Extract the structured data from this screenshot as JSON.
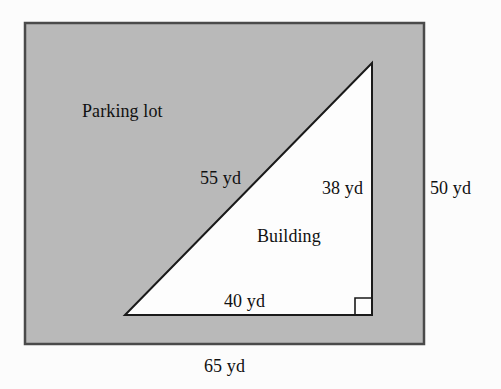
{
  "figure": {
    "background_color": "#fcfcfc",
    "lot": {
      "name": "Parking lot",
      "label": "Parking lot",
      "fill_color": "#b9b9b9",
      "stroke_color": "#4a4a4a",
      "width_label": "65 yd",
      "height_label": "50 yd"
    },
    "building": {
      "name": "Building",
      "label": "Building",
      "fill_color": "#ffffff",
      "stroke_color": "#1a1a1a",
      "hypotenuse_label": "55 yd",
      "vertical_leg_label": "38 yd",
      "horizontal_leg_label": "40 yd",
      "right_angle_marker": "square"
    },
    "labels": {
      "parking_lot": "Parking lot",
      "building": "Building",
      "hypotenuse": "55 yd",
      "vertical_leg": "38 yd",
      "horizontal_leg": "40 yd",
      "lot_height": "50 yd",
      "lot_width": "65 yd"
    }
  }
}
